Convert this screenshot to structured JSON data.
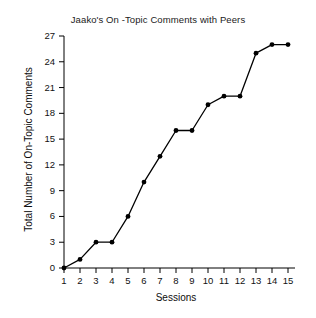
{
  "chart_data": {
    "type": "line",
    "title": "Jaako's On -Topic Comments with Peers",
    "xlabel": "Sessions",
    "ylabel": "Total Number of On-Topic Comments",
    "x": [
      1,
      2,
      3,
      4,
      5,
      6,
      7,
      8,
      9,
      10,
      11,
      12,
      13,
      14,
      15
    ],
    "values": [
      0,
      1,
      3,
      3,
      6,
      10,
      13,
      16,
      16,
      19,
      20,
      20,
      25,
      26,
      26
    ],
    "series": [
      {
        "name": "Total On-Topic Comments",
        "values": [
          0,
          1,
          3,
          3,
          6,
          10,
          13,
          16,
          16,
          19,
          20,
          20,
          25,
          26,
          26
        ]
      }
    ],
    "xticks": [
      "1",
      "2",
      "3",
      "4",
      "5",
      "6",
      "7",
      "8",
      "9",
      "10",
      "11",
      "12",
      "13",
      "14",
      "15"
    ],
    "yticks": [
      "0",
      "3",
      "6",
      "9",
      "12",
      "15",
      "18",
      "21",
      "24",
      "27"
    ],
    "ytick_values": [
      0,
      3,
      6,
      9,
      12,
      15,
      18,
      21,
      24,
      27
    ],
    "xlim": [
      1,
      15
    ],
    "ylim": [
      0,
      27
    ],
    "grid": false,
    "legend": false,
    "legend_position": "none",
    "marker": "filled-circle",
    "line_color": "#000000",
    "marker_color": "#000000",
    "axis_color": "#000000",
    "background_color": "#ffffff"
  }
}
